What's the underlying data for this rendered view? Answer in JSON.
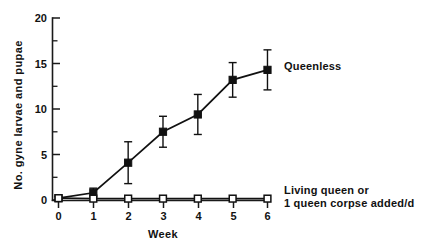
{
  "chart_data": {
    "type": "line",
    "title": "",
    "xlabel": "Week",
    "ylabel": "No. gyne larvae and pupae",
    "x": [
      0,
      1,
      2,
      3,
      4,
      5,
      6
    ],
    "xlim": [
      0,
      6
    ],
    "ylim": [
      0,
      20
    ],
    "xticks": [
      "0",
      "1",
      "2",
      "3",
      "4",
      "5",
      "6"
    ],
    "yticks": [
      "0",
      "5",
      "10",
      "15",
      "20"
    ],
    "y_minor_ticks": [
      2.5,
      7.5,
      12.5,
      17.5
    ],
    "grid": false,
    "legend_position": "inline-right",
    "series": [
      {
        "name": "Queenless",
        "marker": "filled-square",
        "values": [
          0.2,
          0.8,
          4.1,
          7.5,
          9.4,
          13.2,
          14.3
        ],
        "errors": [
          0.2,
          0.5,
          2.3,
          1.7,
          2.2,
          1.9,
          2.2
        ],
        "label": "Queenless",
        "label_x": 6,
        "label_y": 14.3
      },
      {
        "name": "Living queen or 1 queen corpse added/d",
        "marker": "open-square",
        "values": [
          0.2,
          0.15,
          0.15,
          0.15,
          0.15,
          0.15,
          0.15
        ],
        "errors": [
          0,
          0,
          0,
          0,
          0,
          0,
          0
        ],
        "label_line_1": "Living queen or",
        "label_line_2": "1 queen corpse added/d"
      }
    ],
    "annotations": [
      {
        "text": "Queenless"
      },
      {
        "text": "Living queen or"
      },
      {
        "text": "1 queen corpse added/d"
      }
    ]
  },
  "axes": {
    "y_axis_title": "No. gyne larvae and pupae",
    "x_axis_title": "Week"
  },
  "labels": {
    "queenless": "Queenless",
    "queenright_line1": "Living queen or",
    "queenright_line2": "1 queen corpse added/d"
  },
  "colors": {
    "ink": "#111111",
    "background": "#ffffff"
  }
}
